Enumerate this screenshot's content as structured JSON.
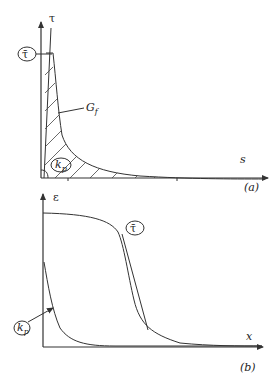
{
  "panel_a": {
    "y_axis_label": "τ",
    "x_axis_label": "s",
    "tau_bar_label": "τ̄",
    "area_label": "G",
    "area_label_sub": "f",
    "kp_label": "k",
    "kp_label_sub": "p",
    "panel_tag": "(a)"
  },
  "panel_b": {
    "y_axis_label": "ε",
    "x_axis_label": "x",
    "tau_bar_label": "τ̄",
    "kp_label": "k",
    "kp_label_sub": "p",
    "panel_tag": "(b)"
  }
}
